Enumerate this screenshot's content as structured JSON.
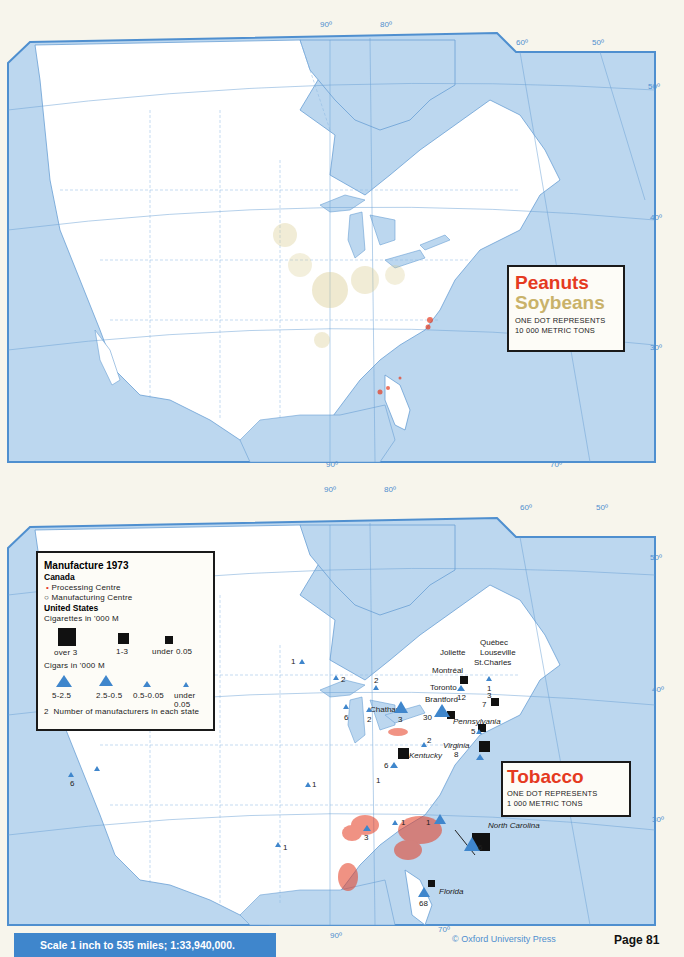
{
  "maps": {
    "top": {
      "title_primary": "Peanuts",
      "title_secondary": "Soybeans",
      "note_line1": "ONE DOT REPRESENTS",
      "note_line2": "10 000 METRIC TONS",
      "longitude_labels_top": [
        "90º",
        "80º",
        "60º",
        "50º"
      ],
      "longitude_labels_bottom": [
        "90º",
        "70º"
      ],
      "latitude_labels_right": [
        "50º",
        "40º",
        "30º"
      ],
      "latitude_labels_left": [
        "50º",
        "40º",
        "30º"
      ],
      "colors": {
        "peanuts": "#e53a1f",
        "soybeans": "#c9b26a",
        "water": "#bcd7ef",
        "border": "#4f8fcf"
      }
    },
    "bottom": {
      "title": "Tobacco",
      "note_line1": "ONE DOT REPRESENTS",
      "note_line2": "1 000 METRIC TONS",
      "longitude_labels_top": [
        "90º",
        "80º",
        "60º",
        "50º"
      ],
      "longitude_labels_bottom": [
        "90º",
        "70º"
      ],
      "latitude_labels_right": [
        "50º",
        "40º",
        "30º"
      ],
      "latitude_labels_left": [
        "50º",
        "40º",
        "30º"
      ],
      "legend": {
        "title": "Manufacture 1973",
        "canada_heading": "Canada",
        "processing_centre": "Processing Centre",
        "manufacturing_centre": "Manufacturing Centre",
        "us_heading": "United States",
        "cigarettes_heading": "Cigarettes in '000 M",
        "cigarette_classes": [
          "over 3",
          "1-3",
          "under 0.05"
        ],
        "cigars_heading": "Cigars in '000 M",
        "cigar_classes": [
          "5-2.5",
          "2.5-0.5",
          "0.5-0.05",
          "under 0.05"
        ],
        "manufacturer_note_number": "2",
        "manufacturer_note": "Number of manufacturers in each state"
      },
      "cities": {
        "quebec": "Québec",
        "louseville": "Louseville",
        "joliette": "Joliette",
        "st_charles": "St.Charles",
        "montreal": "Montréal",
        "toronto": "Toronto",
        "brantford": "Brantford",
        "chatham": "Chatham"
      },
      "states": {
        "pennsylvania": "Pennsylvania",
        "virginia": "Virginia",
        "kentucky": "Kentucky",
        "north_carolina": "North Carolina",
        "florida": "Florida"
      },
      "manufacturer_counts": {
        "minnesota": "1",
        "wisconsin": "2",
        "michigan": "2",
        "illinois": "6",
        "indiana": "2",
        "ohio": "3",
        "new_york": "12",
        "vermont": "1",
        "massachusetts": "3",
        "connecticut": "7",
        "new_jersey": "5",
        "pennsylvania": "30",
        "west_virginia": "2",
        "virginia": "8",
        "kentucky": "6",
        "tennessee": "1",
        "north_carolina": "6",
        "south_carolina": "1",
        "georgia": "1",
        "alabama": "3",
        "missouri": "1",
        "texas": "1",
        "california": "6",
        "florida": "68"
      },
      "colors": {
        "tobacco": "#e53a1f",
        "cigars": "#3f86cc",
        "cigarettes": "#111111"
      }
    }
  },
  "footer": {
    "scale": "Scale 1 inch to 535 miles; 1:33,940,000.",
    "copyright": "© Oxford University Press",
    "page": "Page 81"
  }
}
